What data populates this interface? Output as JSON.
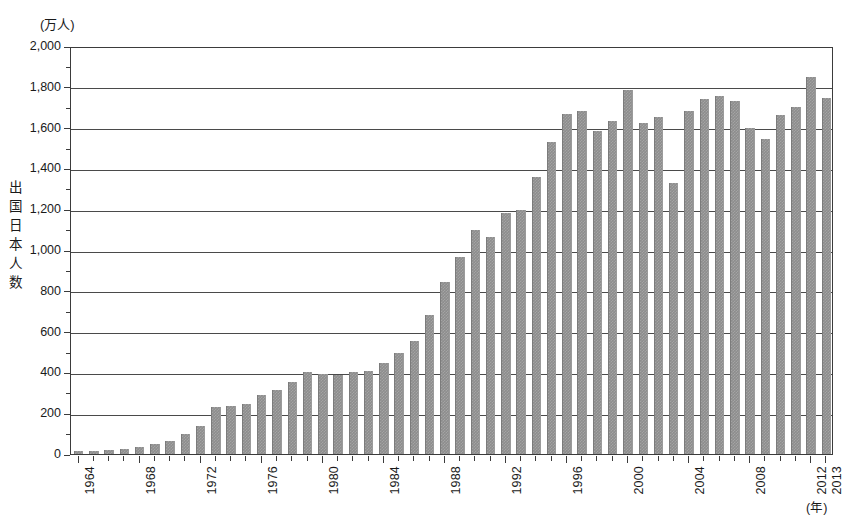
{
  "chart_data": {
    "type": "bar",
    "title": "",
    "unit_label": "(万人)",
    "ylabel": "出国日本人数",
    "xlabel": "(年)",
    "ylim": [
      0,
      2000
    ],
    "ytick_values": [
      0,
      200,
      400,
      600,
      800,
      1000,
      1200,
      1400,
      1600,
      1800,
      2000
    ],
    "ytick_labels": [
      "0",
      "200",
      "400",
      "600",
      "800",
      "1,000",
      "1,200",
      "1,400",
      "1,600",
      "1,800",
      "2,000"
    ],
    "grid": true,
    "legend": "none",
    "xtick_labels_shown": [
      "1964",
      "1968",
      "1972",
      "1976",
      "1980",
      "1984",
      "1988",
      "1992",
      "1996",
      "2000",
      "2004",
      "2008",
      "2012",
      "2013"
    ],
    "categories": [
      "1964",
      "1965",
      "1966",
      "1967",
      "1968",
      "1969",
      "1970",
      "1971",
      "1972",
      "1973",
      "1974",
      "1975",
      "1976",
      "1977",
      "1978",
      "1979",
      "1980",
      "1981",
      "1982",
      "1983",
      "1984",
      "1985",
      "1986",
      "1987",
      "1988",
      "1989",
      "1990",
      "1991",
      "1992",
      "1993",
      "1994",
      "1995",
      "1996",
      "1997",
      "1998",
      "1999",
      "2000",
      "2001",
      "2002",
      "2003",
      "2004",
      "2005",
      "2006",
      "2007",
      "2008",
      "2009",
      "2010",
      "2011",
      "2012",
      "2013"
    ],
    "values": [
      13,
      16,
      21,
      27,
      35,
      49,
      66,
      96,
      139,
      229,
      234,
      247,
      290,
      316,
      354,
      403,
      391,
      389,
      401,
      405,
      446,
      495,
      552,
      683,
      843,
      966,
      1100,
      1063,
      1179,
      1194,
      1358,
      1530,
      1669,
      1680,
      1581,
      1632,
      1782,
      1622,
      1652,
      1330,
      1683,
      1740,
      1753,
      1730,
      1599,
      1545,
      1664,
      1699,
      1849,
      1747
    ]
  },
  "y_axis": {
    "unit": "(万人)",
    "title_chars": [
      "出",
      "国",
      "日",
      "本",
      "人",
      "数"
    ]
  }
}
